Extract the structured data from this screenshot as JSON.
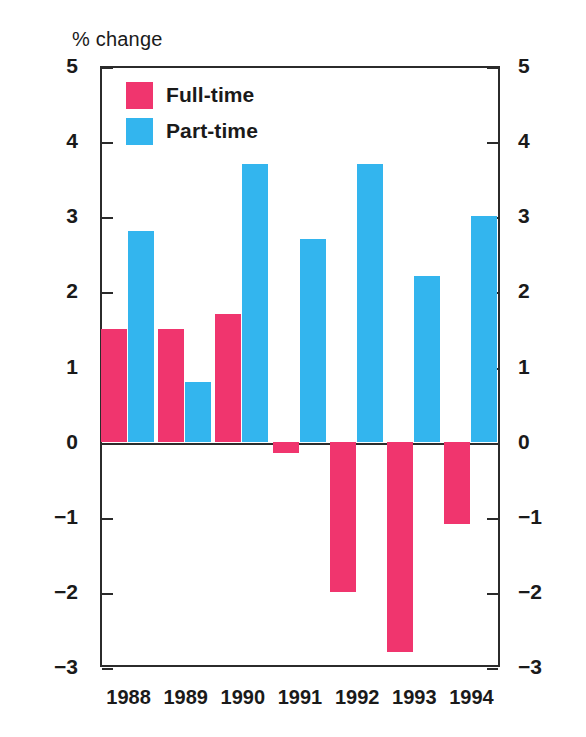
{
  "chart_data": {
    "type": "bar",
    "title": "",
    "ylabel": "% change",
    "xlabel": "",
    "categories": [
      "1988",
      "1989",
      "1990",
      "1991",
      "1992",
      "1993",
      "1994"
    ],
    "series": [
      {
        "name": "Full-time",
        "color": "#f0356e",
        "values": [
          1.5,
          1.5,
          1.7,
          -0.15,
          -2.0,
          -2.8,
          -1.1
        ]
      },
      {
        "name": "Part-time",
        "color": "#33b5ee",
        "values": [
          2.8,
          0.8,
          3.7,
          2.7,
          3.7,
          2.2,
          3.0
        ]
      }
    ],
    "ylim": [
      -3,
      5
    ],
    "yticks": [
      5,
      4,
      3,
      2,
      1,
      0,
      -1,
      -2,
      -3
    ],
    "ytick_labels": [
      "5",
      "4",
      "3",
      "2",
      "1",
      "0",
      "−1",
      "−2",
      "−3"
    ],
    "ytick_labels_right": [
      "5",
      "4",
      "3",
      "2",
      "1",
      "0",
      "−1",
      "−2",
      "−3"
    ],
    "grid": false,
    "legend_position": "top-left",
    "dual_axis": true,
    "zero_line": 0
  },
  "axis": {
    "unit_title": "% change"
  },
  "legend": {
    "items": [
      {
        "label": "Full-time",
        "color": "#f0356e"
      },
      {
        "label": "Part-time",
        "color": "#33b5ee"
      }
    ]
  }
}
